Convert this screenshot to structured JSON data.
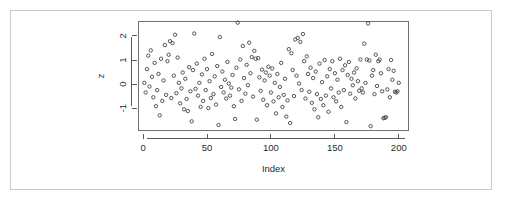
{
  "figure": {
    "kind": "r-base-scatterplot",
    "background_color": "#ffffff",
    "frame_color": "#c9c9c9",
    "point_color": "#3a3a3a",
    "axis_color": "#555b5e"
  },
  "chart_data": {
    "type": "scatter",
    "title": "",
    "subtitle": "",
    "xlabel": "Index",
    "ylabel": "z",
    "marker": "open-circle",
    "grid": false,
    "legend": null,
    "xlim": [
      -4,
      208
    ],
    "ylim": [
      -1.95,
      2.62
    ],
    "xticks": [
      0,
      50,
      100,
      150,
      200
    ],
    "xtick_labels": [
      "0",
      "50",
      "100",
      "150",
      "200"
    ],
    "yticks": [
      -1,
      0,
      1,
      2
    ],
    "ytick_labels": [
      "-1",
      "0",
      "1",
      "2"
    ],
    "ytick_label_rotation": 90,
    "n_points": 200,
    "x": [
      1,
      2,
      3,
      4,
      5,
      6,
      7,
      8,
      9,
      10,
      11,
      12,
      13,
      14,
      15,
      16,
      17,
      18,
      19,
      20,
      21,
      22,
      23,
      24,
      25,
      26,
      27,
      28,
      29,
      30,
      31,
      32,
      33,
      34,
      35,
      36,
      37,
      38,
      39,
      40,
      41,
      42,
      43,
      44,
      45,
      46,
      47,
      48,
      49,
      50,
      51,
      52,
      53,
      54,
      55,
      56,
      57,
      58,
      59,
      60,
      61,
      62,
      63,
      64,
      65,
      66,
      67,
      68,
      69,
      70,
      71,
      72,
      73,
      74,
      75,
      76,
      77,
      78,
      79,
      80,
      81,
      82,
      83,
      84,
      85,
      86,
      87,
      88,
      89,
      90,
      91,
      92,
      93,
      94,
      95,
      96,
      97,
      98,
      99,
      100,
      101,
      102,
      103,
      104,
      105,
      106,
      107,
      108,
      109,
      110,
      111,
      112,
      113,
      114,
      115,
      116,
      117,
      118,
      119,
      120,
      121,
      122,
      123,
      124,
      125,
      126,
      127,
      128,
      129,
      130,
      131,
      132,
      133,
      134,
      135,
      136,
      137,
      138,
      139,
      140,
      141,
      142,
      143,
      144,
      145,
      146,
      147,
      148,
      149,
      150,
      151,
      152,
      153,
      154,
      155,
      156,
      157,
      158,
      159,
      160,
      161,
      162,
      163,
      164,
      165,
      166,
      167,
      168,
      169,
      170,
      171,
      172,
      173,
      174,
      175,
      176,
      177,
      178,
      179,
      180,
      181,
      182,
      183,
      184,
      185,
      186,
      187,
      188,
      189,
      190,
      191,
      192,
      193,
      194,
      195,
      196,
      197,
      198,
      199,
      200
    ],
    "y": [
      0.05,
      -0.35,
      0.62,
      1.18,
      -0.1,
      1.4,
      0.3,
      -0.55,
      0.88,
      -0.92,
      -0.25,
      0.42,
      -1.3,
      1.05,
      -0.7,
      0.15,
      1.62,
      -0.45,
      0.95,
      1.22,
      1.78,
      -0.58,
      1.7,
      0.35,
      2.05,
      -0.38,
      1.1,
      0.05,
      -0.8,
      -0.18,
      0.48,
      -1.05,
      0.22,
      -0.62,
      -1.12,
      0.7,
      -0.3,
      -1.55,
      0.58,
      2.1,
      -0.2,
      0.85,
      -0.48,
      0.05,
      -0.95,
      0.4,
      -0.7,
      1.05,
      -0.25,
      0.62,
      -1.0,
      0.12,
      -0.58,
      1.25,
      -0.42,
      0.32,
      -0.85,
      0.75,
      -1.7,
      1.95,
      -0.12,
      0.52,
      -0.35,
      0.18,
      -0.6,
      0.92,
      0.02,
      -0.48,
      -0.15,
      0.38,
      -0.92,
      -1.45,
      0.68,
      2.55,
      -0.22,
      1.02,
      -0.7,
      1.58,
      0.25,
      -0.4,
      0.8,
      -0.05,
      1.72,
      0.45,
      1.12,
      -0.52,
      1.38,
      1.05,
      -1.48,
      1.08,
      0.28,
      -0.28,
      0.6,
      -0.65,
      0.15,
      0.48,
      -0.88,
      0.72,
      0.35,
      -0.35,
      0.65,
      -0.72,
      0.05,
      -1.22,
      0.42,
      -0.55,
      -0.12,
      0.88,
      -0.95,
      -0.45,
      0.22,
      -1.35,
      -0.68,
      1.45,
      -1.62,
      1.28,
      0.58,
      -0.5,
      1.85,
      0.35,
      1.92,
      0.02,
      1.75,
      -0.25,
      2.08,
      0.95,
      -0.6,
      1.15,
      0.42,
      -0.32,
      0.68,
      -0.78,
      0.25,
      -1.05,
      0.52,
      -0.42,
      -1.38,
      0.85,
      -0.62,
      0.08,
      -0.88,
      1.0,
      -0.48,
      0.32,
      -1.15,
      0.62,
      -0.18,
      0.95,
      -0.55,
      0.45,
      -0.72,
      0.18,
      -0.35,
      1.05,
      -0.95,
      0.58,
      -0.25,
      0.78,
      -1.58,
      0.38,
      0.92,
      -0.4,
      0.22,
      -0.05,
      0.48,
      -0.6,
      0.65,
      0.12,
      -0.28,
      1.02,
      -0.18,
      -0.35,
      1.68,
      0.05,
      1.02,
      2.52,
      0.98,
      -1.75,
      0.35,
      0.58,
      -0.42,
      1.22,
      -0.08,
      0.95,
      1.02,
      0.45,
      -0.3,
      -1.42,
      -1.4,
      -1.38,
      -0.22,
      0.62,
      -0.55,
      1.0,
      0.18,
      0.55,
      -0.32,
      -0.35,
      -0.3,
      0.05
    ]
  },
  "plot_geometry": {
    "box_left": 138,
    "box_top": 21,
    "box_right": 409,
    "box_bottom": 131
  }
}
